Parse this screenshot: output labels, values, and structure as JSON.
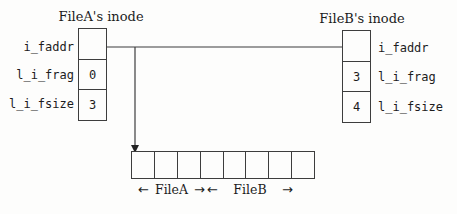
{
  "inode_a": {
    "title": "FileA's inode",
    "fields": [
      {
        "label": "i_faddr",
        "value": ""
      },
      {
        "label": "l_i_frag",
        "value": "0"
      },
      {
        "label": "l_i_fsize",
        "value": "3"
      }
    ]
  },
  "inode_b": {
    "title": "FileB's inode",
    "fields": [
      {
        "label": "i_faddr",
        "value": ""
      },
      {
        "label": "l_i_frag",
        "value": "3"
      },
      {
        "label": "l_i_fsize",
        "value": "4"
      }
    ]
  },
  "fragment_block": {
    "cell_count": 8,
    "spans": [
      {
        "label": "FileA",
        "left_arrow": "←",
        "right_arrow": "→",
        "start_cell": 0,
        "cell_span": 3
      },
      {
        "label": "FileB",
        "left_arrow": "←",
        "right_arrow": "→",
        "start_cell": 3,
        "cell_span": 4
      }
    ]
  },
  "colors": {
    "background": "#fdfdfc",
    "ink": "#1c1c1c",
    "line": "#3d3d3d"
  }
}
